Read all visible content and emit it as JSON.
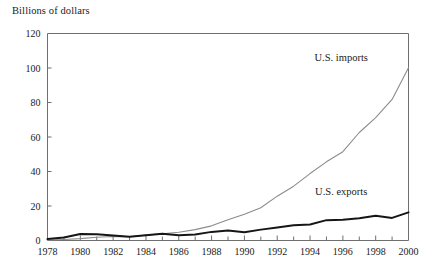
{
  "chart_data": {
    "type": "line",
    "title": "Billions of dollars",
    "xlabel": "",
    "ylabel": "Billions of dollars",
    "xlim": [
      1978,
      2000
    ],
    "ylim": [
      0,
      120
    ],
    "yticks": [
      0,
      20,
      40,
      60,
      80,
      100,
      120
    ],
    "ytick_labels": [
      "0",
      "20",
      "40",
      "60",
      "80",
      "100",
      "120"
    ],
    "xticks": [
      1978,
      1980,
      1982,
      1984,
      1986,
      1988,
      1990,
      1992,
      1994,
      1996,
      1998,
      2000
    ],
    "xtick_labels": [
      "1978",
      "1980",
      "1982",
      "1984",
      "1986",
      "1988",
      "1990",
      "1992",
      "1994",
      "1996",
      "1998",
      "2000"
    ],
    "x_minor_tick_interval": 1,
    "grid": false,
    "legend_position": "inline-right",
    "x": [
      1978,
      1979,
      1980,
      1981,
      1982,
      1983,
      1984,
      1985,
      1986,
      1987,
      1988,
      1989,
      1990,
      1991,
      1992,
      1993,
      1994,
      1995,
      1996,
      1997,
      1998,
      1999,
      2000
    ],
    "series": [
      {
        "name": "U.S. imports",
        "label": "U.S. imports",
        "color": "#8c8c8c",
        "line_width": 1.1,
        "values": [
          0.3,
          0.6,
          1.1,
          1.9,
          2.3,
          2.2,
          3.1,
          3.9,
          4.8,
          6.3,
          8.5,
          12.0,
          15.2,
          19.0,
          25.7,
          31.5,
          38.8,
          45.6,
          51.5,
          62.6,
          71.2,
          81.8,
          100.1
        ]
      },
      {
        "name": "U.S. exports",
        "label": "U.S. exports",
        "color": "#161616",
        "line_width": 2.0,
        "values": [
          0.8,
          1.7,
          3.8,
          3.6,
          2.9,
          2.2,
          3.0,
          3.9,
          3.1,
          3.5,
          5.0,
          5.8,
          4.8,
          6.3,
          7.5,
          8.8,
          9.3,
          11.8,
          12.0,
          12.9,
          14.3,
          13.1,
          16.3
        ]
      }
    ],
    "annotations": [
      {
        "text": "U.S. imports",
        "x": 1995.9,
        "y": 104.0
      },
      {
        "text": "U.S. exports",
        "x": 1995.9,
        "y": 26.5
      }
    ]
  },
  "figure": {
    "background": "#ffffff",
    "axis_color": "#6f6f6f",
    "text_color": "#1a1a1a"
  }
}
